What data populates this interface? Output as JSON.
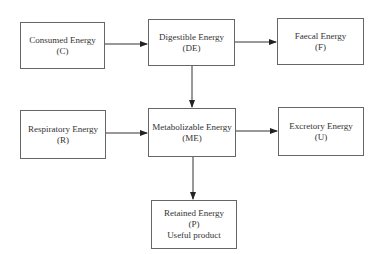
{
  "diagram": {
    "nodes": [
      {
        "id": "consumed",
        "lines": [
          "Consumed Energy",
          "(C)"
        ]
      },
      {
        "id": "digestible",
        "lines": [
          "Digestible Energy",
          "(DE)"
        ]
      },
      {
        "id": "faecal",
        "lines": [
          "Faecal Energy",
          "(F)"
        ]
      },
      {
        "id": "respiratory",
        "lines": [
          "Respiratory Energy",
          "(R)"
        ]
      },
      {
        "id": "metabolizable",
        "lines": [
          "Metabolizable Energy",
          "(ME)"
        ]
      },
      {
        "id": "excretory",
        "lines": [
          "Excretory Energy",
          "(U)"
        ]
      },
      {
        "id": "retained",
        "lines": [
          "Retained Energy",
          "(P)",
          "Useful product"
        ]
      }
    ],
    "edges": [
      {
        "from": "consumed",
        "to": "digestible"
      },
      {
        "from": "digestible",
        "to": "faecal"
      },
      {
        "from": "digestible",
        "to": "metabolizable"
      },
      {
        "from": "respiratory",
        "to": "metabolizable"
      },
      {
        "from": "metabolizable",
        "to": "excretory"
      },
      {
        "from": "metabolizable",
        "to": "retained"
      }
    ]
  }
}
